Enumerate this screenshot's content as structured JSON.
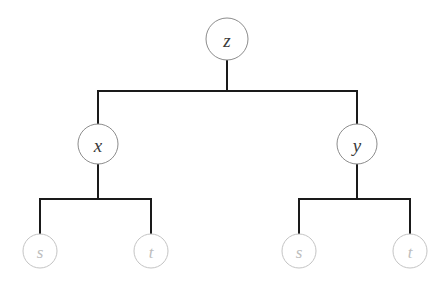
{
  "diagram": {
    "type": "tree",
    "title": "",
    "background_color": "#ffffff",
    "edge_color": "#1a1a1a",
    "edge_width": 2,
    "internal_circle_stroke": "#8c8c8c",
    "internal_label_color": "#3a3a3a",
    "leaf_circle_stroke": "#c4c4c4",
    "leaf_label_color": "#bdbdbd",
    "nodes": [
      {
        "id": "root-z",
        "label": "z",
        "kind": "internal",
        "cx": 227,
        "cy": 39,
        "r": 21
      },
      {
        "id": "internal-x",
        "label": "x",
        "kind": "internal",
        "cx": 98,
        "cy": 144,
        "r": 20
      },
      {
        "id": "internal-y",
        "label": "y",
        "kind": "internal",
        "cx": 357,
        "cy": 144,
        "r": 20
      },
      {
        "id": "leaf-s-left",
        "label": "s",
        "kind": "leaf",
        "cx": 40,
        "cy": 251,
        "r": 17
      },
      {
        "id": "leaf-t-left",
        "label": "t",
        "kind": "leaf",
        "cx": 151,
        "cy": 251,
        "r": 17
      },
      {
        "id": "leaf-s-right",
        "label": "s",
        "kind": "leaf",
        "cx": 299,
        "cy": 251,
        "r": 17
      },
      {
        "id": "leaf-t-right",
        "label": "t",
        "kind": "leaf",
        "cx": 410,
        "cy": 251,
        "r": 17
      }
    ],
    "edges": [
      {
        "id": "edge-z-bus",
        "from": "root-z",
        "to": "bus-top",
        "path": "M 227 60 L 227 91"
      },
      {
        "id": "edge-bus-top",
        "from": "bus-top",
        "to": "bus-top",
        "path": "M 98 91 L 357 91"
      },
      {
        "id": "edge-bus-x",
        "from": "bus-top",
        "to": "internal-x",
        "path": "M 98 91 L 98 124"
      },
      {
        "id": "edge-bus-y",
        "from": "bus-top",
        "to": "internal-y",
        "path": "M 357 91 L 357 124"
      },
      {
        "id": "edge-x-bus",
        "from": "internal-x",
        "to": "bus-left",
        "path": "M 98 164 L 98 199"
      },
      {
        "id": "edge-bus-left",
        "from": "bus-left",
        "to": "bus-left",
        "path": "M 40 199 L 151 199"
      },
      {
        "id": "edge-left-s",
        "from": "bus-left",
        "to": "leaf-s-left",
        "path": "M 40 199 L 40 234"
      },
      {
        "id": "edge-left-t",
        "from": "bus-left",
        "to": "leaf-t-left",
        "path": "M 151 199 L 151 234"
      },
      {
        "id": "edge-y-bus",
        "from": "internal-y",
        "to": "bus-right",
        "path": "M 357 164 L 357 199"
      },
      {
        "id": "edge-bus-right",
        "from": "bus-right",
        "to": "bus-right",
        "path": "M 299 199 L 410 199"
      },
      {
        "id": "edge-right-s",
        "from": "bus-right",
        "to": "leaf-s-right",
        "path": "M 299 199 L 299 234"
      },
      {
        "id": "edge-right-t",
        "from": "bus-right",
        "to": "leaf-t-right",
        "path": "M 410 199 L 410 234"
      }
    ]
  }
}
